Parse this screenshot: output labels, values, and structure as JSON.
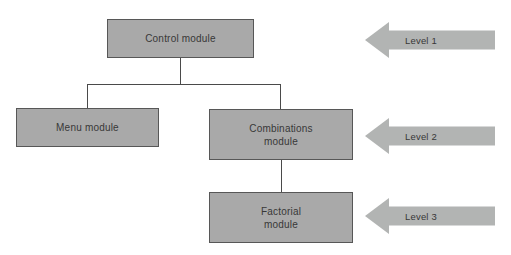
{
  "diagram": {
    "nodes": [
      {
        "id": "control",
        "label": "Control module",
        "level": 1
      },
      {
        "id": "menu",
        "label": "Menu module",
        "level": 2
      },
      {
        "id": "combinations",
        "label": "Combinations\nmodule",
        "level": 2
      },
      {
        "id": "factorial",
        "label": "Factorial\nmodule",
        "level": 3
      }
    ],
    "edges": [
      {
        "from": "control",
        "to": "menu"
      },
      {
        "from": "control",
        "to": "combinations"
      },
      {
        "from": "combinations",
        "to": "factorial"
      }
    ],
    "arrows": [
      {
        "label": "Level 1"
      },
      {
        "label": "Level 2"
      },
      {
        "label": "Level 3"
      }
    ],
    "colors": {
      "background": "#ffffff",
      "box_fill": "#a9a9a9",
      "box_border": "#575757",
      "arrow_fill": "#b2b4b3",
      "connector": "#4a4a4a",
      "text": "#383838"
    }
  }
}
